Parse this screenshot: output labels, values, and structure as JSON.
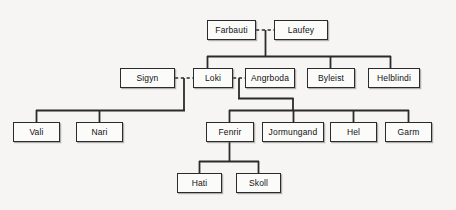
{
  "diagram": {
    "type": "family-tree",
    "background_color": "#f6f5f3",
    "node_fill": "#fbfbfa",
    "node_stroke": "#2b2b2b",
    "edge_color": "#2b2b2b",
    "nodes": [
      {
        "id": "farbauti",
        "label": "Farbauti",
        "x": 207,
        "y": 20,
        "w": 49,
        "h": 20,
        "generation": 1
      },
      {
        "id": "laufey",
        "label": "Laufey",
        "x": 274,
        "y": 20,
        "w": 54,
        "h": 20,
        "generation": 1
      },
      {
        "id": "sigyn",
        "label": "Sigyn",
        "x": 120,
        "y": 68,
        "w": 55,
        "h": 20,
        "generation": 2
      },
      {
        "id": "loki",
        "label": "Loki",
        "x": 193,
        "y": 68,
        "w": 40,
        "h": 20,
        "generation": 2
      },
      {
        "id": "angrboda",
        "label": "Angrboda",
        "x": 245,
        "y": 68,
        "w": 50,
        "h": 20,
        "generation": 2
      },
      {
        "id": "byleist",
        "label": "Byleist",
        "x": 307,
        "y": 68,
        "w": 48,
        "h": 20,
        "generation": 2
      },
      {
        "id": "helblindi",
        "label": "Helblindi",
        "x": 368,
        "y": 68,
        "w": 52,
        "h": 20,
        "generation": 2
      },
      {
        "id": "vali",
        "label": "Vali",
        "x": 13,
        "y": 122,
        "w": 47,
        "h": 20,
        "generation": 3
      },
      {
        "id": "nari",
        "label": "Nari",
        "x": 76,
        "y": 122,
        "w": 47,
        "h": 20,
        "generation": 3
      },
      {
        "id": "fenrir",
        "label": "Fenrir",
        "x": 206,
        "y": 122,
        "w": 48,
        "h": 20,
        "generation": 3
      },
      {
        "id": "jormungand",
        "label": "Jormungand",
        "x": 262,
        "y": 122,
        "w": 62,
        "h": 20,
        "generation": 3
      },
      {
        "id": "hel",
        "label": "Hel",
        "x": 330,
        "y": 122,
        "w": 47,
        "h": 20,
        "generation": 3
      },
      {
        "id": "garm",
        "label": "Garm",
        "x": 385,
        "y": 122,
        "w": 47,
        "h": 20,
        "generation": 3
      },
      {
        "id": "hati",
        "label": "Hati",
        "x": 177,
        "y": 173,
        "w": 45,
        "h": 20,
        "generation": 4
      },
      {
        "id": "skoll",
        "label": "Skoll",
        "x": 236,
        "y": 173,
        "w": 45,
        "h": 20,
        "generation": 4
      }
    ],
    "unions": [
      {
        "id": "union-farbauti-laufey",
        "partners": [
          "farbauti",
          "laufey"
        ],
        "style": "dashed",
        "children": [
          "loki",
          "byleist",
          "helblindi"
        ]
      },
      {
        "id": "union-sigyn-loki",
        "partners": [
          "sigyn",
          "loki"
        ],
        "style": "dashed",
        "children": [
          "vali",
          "nari"
        ]
      },
      {
        "id": "union-loki-angrboda",
        "partners": [
          "loki",
          "angrboda"
        ],
        "style": "dashed",
        "children": [
          "fenrir",
          "jormungand",
          "hel",
          "garm"
        ]
      }
    ],
    "descents": [
      {
        "id": "descent-fenrir",
        "parent": "fenrir",
        "children": [
          "hati",
          "skoll"
        ]
      }
    ]
  }
}
